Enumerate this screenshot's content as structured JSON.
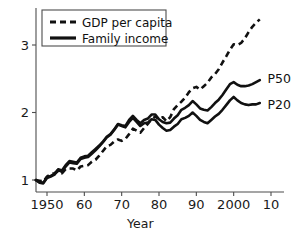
{
  "chart_data": {
    "type": "line",
    "title": "",
    "subtitle": "",
    "xlabel": "Year",
    "ylabel": "",
    "xlim": [
      1946,
      2012
    ],
    "ylim": [
      0.72,
      3.52
    ],
    "grid": false,
    "legend_position": "top-left",
    "xticks": [
      {
        "value": 1950,
        "label": "1950"
      },
      {
        "value": 1960,
        "label": "60"
      },
      {
        "value": 1970,
        "label": "70"
      },
      {
        "value": 1980,
        "label": "80"
      },
      {
        "value": 1990,
        "label": "90"
      },
      {
        "value": 2000,
        "label": "2000"
      },
      {
        "value": 2010,
        "label": "10"
      }
    ],
    "yticks": [
      {
        "value": 1,
        "label": "1"
      },
      {
        "value": 2,
        "label": "2"
      },
      {
        "value": 3,
        "label": "3"
      }
    ],
    "legend": [
      {
        "name": "GDP per capita",
        "style": "dashed"
      },
      {
        "name": "Family income",
        "style": "solid"
      }
    ],
    "annotations": [
      {
        "text": "P50",
        "x": 2008,
        "y": 2.5
      },
      {
        "text": "P20",
        "x": 2008,
        "y": 2.12
      }
    ],
    "series": [
      {
        "name": "GDP per capita",
        "style": "dashed",
        "x": [
          1947,
          1948,
          1949,
          1950,
          1951,
          1952,
          1953,
          1954,
          1955,
          1956,
          1957,
          1958,
          1959,
          1960,
          1961,
          1962,
          1963,
          1964,
          1965,
          1966,
          1967,
          1968,
          1969,
          1970,
          1971,
          1972,
          1973,
          1974,
          1975,
          1976,
          1977,
          1978,
          1979,
          1980,
          1981,
          1982,
          1983,
          1984,
          1985,
          1986,
          1987,
          1988,
          1989,
          1990,
          1991,
          1992,
          1993,
          1994,
          1995,
          1996,
          1997,
          1998,
          1999,
          2000,
          2001,
          2002,
          2003,
          2004,
          2005,
          2006,
          2007
        ],
        "values": [
          1.0,
          0.99,
          0.98,
          1.05,
          1.09,
          1.1,
          1.13,
          1.1,
          1.16,
          1.17,
          1.17,
          1.14,
          1.2,
          1.21,
          1.22,
          1.27,
          1.3,
          1.36,
          1.43,
          1.5,
          1.52,
          1.57,
          1.6,
          1.58,
          1.61,
          1.68,
          1.76,
          1.73,
          1.7,
          1.77,
          1.83,
          1.9,
          1.94,
          1.9,
          1.93,
          1.87,
          1.93,
          2.05,
          2.11,
          2.16,
          2.22,
          2.3,
          2.36,
          2.38,
          2.34,
          2.39,
          2.44,
          2.52,
          2.57,
          2.64,
          2.74,
          2.83,
          2.93,
          3.01,
          3.0,
          3.03,
          3.1,
          3.19,
          3.27,
          3.33,
          3.38
        ]
      },
      {
        "name": "Family income P50",
        "style": "solid",
        "x": [
          1947,
          1948,
          1949,
          1950,
          1951,
          1952,
          1953,
          1954,
          1955,
          1956,
          1957,
          1958,
          1959,
          1960,
          1961,
          1962,
          1963,
          1964,
          1965,
          1966,
          1967,
          1968,
          1969,
          1970,
          1971,
          1972,
          1973,
          1974,
          1975,
          1976,
          1977,
          1978,
          1979,
          1980,
          1981,
          1982,
          1983,
          1984,
          1985,
          1986,
          1987,
          1988,
          1989,
          1990,
          1991,
          1992,
          1993,
          1994,
          1995,
          1996,
          1997,
          1998,
          1999,
          2000,
          2001,
          2002,
          2003,
          2004,
          2005,
          2006,
          2007
        ],
        "values": [
          1.0,
          0.97,
          0.96,
          1.04,
          1.06,
          1.09,
          1.16,
          1.14,
          1.22,
          1.28,
          1.27,
          1.26,
          1.33,
          1.35,
          1.36,
          1.41,
          1.46,
          1.51,
          1.57,
          1.64,
          1.68,
          1.75,
          1.83,
          1.81,
          1.8,
          1.89,
          1.95,
          1.89,
          1.84,
          1.89,
          1.91,
          1.97,
          1.97,
          1.9,
          1.86,
          1.84,
          1.85,
          1.91,
          1.96,
          2.04,
          2.07,
          2.11,
          2.17,
          2.12,
          2.06,
          2.04,
          2.03,
          2.08,
          2.14,
          2.19,
          2.26,
          2.34,
          2.42,
          2.45,
          2.41,
          2.39,
          2.39,
          2.4,
          2.42,
          2.45,
          2.48
        ]
      },
      {
        "name": "Family income P20",
        "style": "solid",
        "x": [
          1947,
          1948,
          1949,
          1950,
          1951,
          1952,
          1953,
          1954,
          1955,
          1956,
          1957,
          1958,
          1959,
          1960,
          1961,
          1962,
          1963,
          1964,
          1965,
          1966,
          1967,
          1968,
          1969,
          1970,
          1971,
          1972,
          1973,
          1974,
          1975,
          1976,
          1977,
          1978,
          1979,
          1980,
          1981,
          1982,
          1983,
          1984,
          1985,
          1986,
          1987,
          1988,
          1989,
          1990,
          1991,
          1992,
          1993,
          1994,
          1995,
          1996,
          1997,
          1998,
          1999,
          2000,
          2001,
          2002,
          2003,
          2004,
          2005,
          2006,
          2007
        ],
        "values": [
          1.0,
          0.96,
          0.95,
          1.03,
          1.05,
          1.08,
          1.15,
          1.12,
          1.2,
          1.26,
          1.25,
          1.24,
          1.31,
          1.33,
          1.34,
          1.39,
          1.44,
          1.5,
          1.56,
          1.63,
          1.67,
          1.74,
          1.82,
          1.8,
          1.78,
          1.86,
          1.92,
          1.86,
          1.8,
          1.84,
          1.85,
          1.9,
          1.89,
          1.82,
          1.77,
          1.73,
          1.74,
          1.79,
          1.83,
          1.9,
          1.92,
          1.95,
          2.0,
          1.95,
          1.89,
          1.86,
          1.84,
          1.89,
          1.94,
          1.98,
          2.04,
          2.11,
          2.18,
          2.23,
          2.18,
          2.14,
          2.12,
          2.11,
          2.12,
          2.12,
          2.14
        ]
      }
    ]
  }
}
